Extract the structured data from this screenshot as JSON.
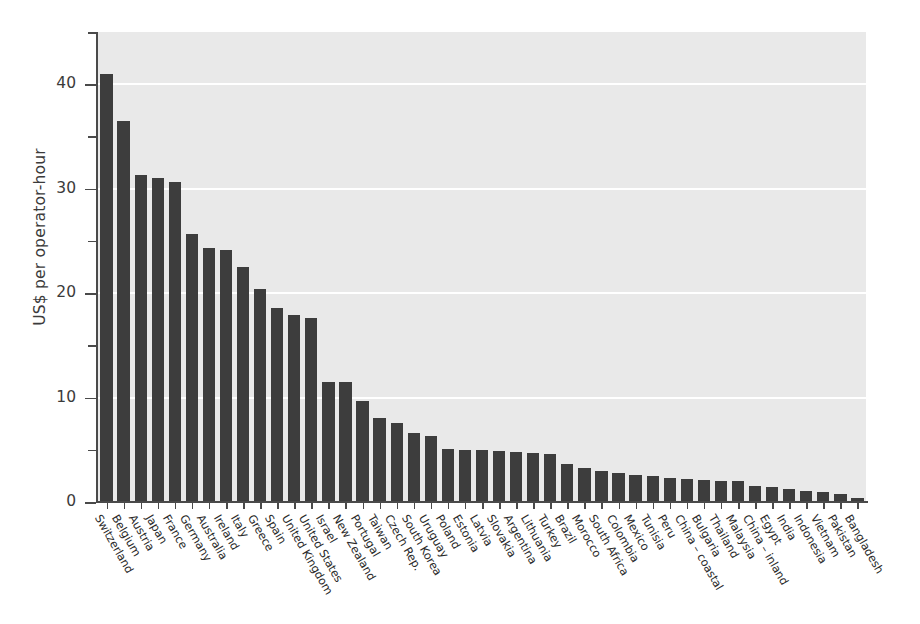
{
  "chart_data": {
    "type": "bar",
    "title": "",
    "xlabel": "",
    "ylabel": "US$ per operator-hour",
    "ylim": [
      0,
      45
    ],
    "ytick_labels": [
      "0",
      "10",
      "20",
      "30",
      "40"
    ],
    "ytick_values": [
      0,
      10,
      20,
      30,
      40
    ],
    "yminor_values": [
      5,
      15,
      25,
      35,
      45
    ],
    "grid": true,
    "gridlines_at": [
      10,
      20,
      30,
      40
    ],
    "legend": "none",
    "bar_color": "#3d3d3d",
    "plot_background": "#e9e9e9",
    "gridline_color": "#ffffff",
    "axis_color": "#4a4a4a",
    "categories": [
      "Switzerland",
      "Belgium",
      "Austria",
      "Japan",
      "France",
      "Germany",
      "Australia",
      "Ireland",
      "Italy",
      "Greece",
      "Spain",
      "United Kingdom",
      "United States",
      "Israel",
      "New Zealand",
      "Portugal",
      "Taiwan",
      "Czech Rep.",
      "South Korea",
      "Uruguay",
      "Poland",
      "Estonia",
      "Latvia",
      "Slovakia",
      "Argentina",
      "Lithuania",
      "Turkey",
      "Brazil",
      "Morocco",
      "South Africa",
      "Colombia",
      "Mexico",
      "Tunisia",
      "Peru",
      "China – coastal",
      "Bulgaria",
      "Thailand",
      "Malaysia",
      "China – inland",
      "Egypt",
      "India",
      "Indonesia",
      "Vietnam",
      "Pakistan",
      "Bangladesh"
    ],
    "values": [
      41.0,
      36.5,
      31.3,
      31.0,
      30.6,
      25.7,
      24.3,
      24.1,
      22.5,
      20.4,
      18.6,
      17.9,
      17.6,
      11.5,
      11.5,
      9.7,
      8.0,
      7.6,
      6.6,
      6.3,
      5.1,
      5.0,
      5.0,
      4.9,
      4.8,
      4.7,
      4.6,
      3.6,
      3.3,
      3.0,
      2.8,
      2.6,
      2.5,
      2.3,
      2.2,
      2.1,
      2.0,
      2.0,
      1.5,
      1.4,
      1.2,
      1.1,
      1.0,
      0.8,
      0.4
    ]
  }
}
